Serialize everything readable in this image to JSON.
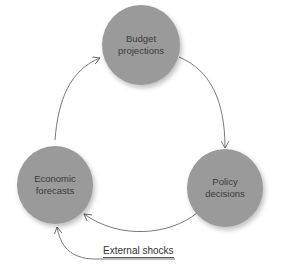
{
  "nodes": {
    "budget": {
      "line1": "Budget",
      "line2": "projections"
    },
    "policy": {
      "line1": "Policy",
      "line2": "decisions"
    },
    "economic": {
      "line1": "Economic",
      "line2": "forecasts"
    }
  },
  "external": {
    "label": "External shocks"
  },
  "colors": {
    "node": "#9a9a9a",
    "arrow": "#555555"
  }
}
